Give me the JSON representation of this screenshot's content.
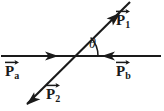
{
  "figure": {
    "type": "vector-diagram",
    "background_color": "#ffffff",
    "stroke_color": "#1a1a1a"
  },
  "labels": {
    "p1": {
      "symbol": "P",
      "subscript": "1",
      "vector": true
    },
    "p2": {
      "symbol": "P",
      "subscript": "2",
      "vector": true
    },
    "pa": {
      "symbol": "P",
      "subscript": "a",
      "vector": true
    },
    "pb": {
      "symbol": "P",
      "subscript": "b",
      "vector": true
    },
    "theta": {
      "symbol": "θ"
    }
  },
  "geometry": {
    "intersection": {
      "x": 72,
      "y": 56
    },
    "horizontal_line": {
      "x1": 1,
      "y1": 56,
      "x2": 161,
      "y2": 56
    },
    "diagonal_line": {
      "x1": 27,
      "y1": 104,
      "x2": 130,
      "y2": 2
    },
    "arrowheads": [
      {
        "name": "pa-arrowhead",
        "x": 55,
        "y": 56,
        "direction": "right"
      },
      {
        "name": "pb-arrowhead",
        "x": 104,
        "y": 56,
        "direction": "left"
      },
      {
        "name": "p1-arrowhead",
        "x": 115,
        "y": 18,
        "direction": "up-right"
      },
      {
        "name": "p2-arrowhead",
        "x": 32,
        "y": 99,
        "direction": "down-left"
      }
    ],
    "angle_arc": {
      "center_x": 72,
      "center_y": 56,
      "radius": 26,
      "from_deg": 0,
      "to_deg": 45
    }
  }
}
